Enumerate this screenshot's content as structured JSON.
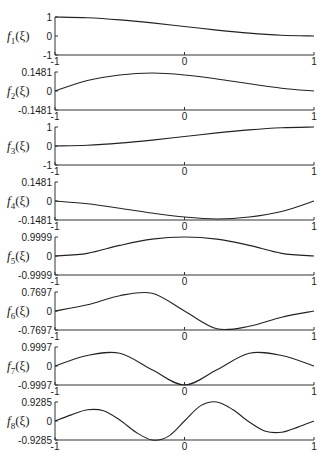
{
  "chart_data": [
    {
      "type": "line",
      "title": "",
      "ylabel": "f_1(ξ)",
      "ylabel_base": "f",
      "ylabel_sub": "1",
      "xlim": [
        -1,
        1
      ],
      "ylim": [
        -1,
        1
      ],
      "xticks": [
        "-1",
        "0",
        "1"
      ],
      "yticks": [
        "1",
        "0",
        "-1"
      ],
      "x": [
        -1,
        -0.75,
        -0.5,
        -0.25,
        0,
        0.25,
        0.5,
        0.75,
        1
      ],
      "y": [
        1.0,
        0.96,
        0.85,
        0.69,
        0.5,
        0.31,
        0.15,
        0.04,
        0.0
      ]
    },
    {
      "type": "line",
      "title": "",
      "ylabel": "f_2(ξ)",
      "ylabel_base": "f",
      "ylabel_sub": "2",
      "xlim": [
        -1,
        1
      ],
      "ylim": [
        -0.1481,
        0.1481
      ],
      "xticks": [
        "-1",
        "0",
        "1"
      ],
      "yticks": [
        "0.1481",
        "0",
        "-0.1481"
      ],
      "x": [
        -1,
        -0.75,
        -0.5,
        -0.25,
        0,
        0.25,
        0.5,
        0.75,
        1
      ],
      "y": [
        0.0,
        0.082,
        0.125,
        0.14,
        0.125,
        0.094,
        0.056,
        0.022,
        0.0
      ]
    },
    {
      "type": "line",
      "title": "",
      "ylabel": "f_3(ξ)",
      "ylabel_base": "f",
      "ylabel_sub": "3",
      "xlim": [
        -1,
        1
      ],
      "ylim": [
        -1,
        1
      ],
      "xticks": [
        "-1",
        "0",
        "1"
      ],
      "yticks": [
        "1",
        "0",
        "-1"
      ],
      "x": [
        -1,
        -0.75,
        -0.5,
        -0.25,
        0,
        0.25,
        0.5,
        0.75,
        1
      ],
      "y": [
        0.0,
        0.04,
        0.15,
        0.31,
        0.5,
        0.69,
        0.85,
        0.96,
        1.0
      ]
    },
    {
      "type": "line",
      "title": "",
      "ylabel": "f_4(ξ)",
      "ylabel_base": "f",
      "ylabel_sub": "4",
      "xlim": [
        -1,
        1
      ],
      "ylim": [
        -0.1481,
        0.1481
      ],
      "xticks": [
        "-1",
        "0",
        "1"
      ],
      "yticks": [
        "0.1481",
        "0",
        "-0.1481"
      ],
      "x": [
        -1,
        -0.75,
        -0.5,
        -0.25,
        0,
        0.25,
        0.5,
        0.75,
        1
      ],
      "y": [
        0.0,
        -0.022,
        -0.056,
        -0.094,
        -0.125,
        -0.14,
        -0.125,
        -0.082,
        0.0
      ]
    },
    {
      "type": "line",
      "title": "",
      "ylabel": "f_5(ξ)",
      "ylabel_base": "f",
      "ylabel_sub": "5",
      "xlim": [
        -1,
        1
      ],
      "ylim": [
        -0.9999,
        0.9999
      ],
      "xticks": [
        "-1",
        "0",
        "1"
      ],
      "yticks": [
        "0.9999",
        "0",
        "-0.9999"
      ],
      "x": [
        -1,
        -0.75,
        -0.5,
        -0.25,
        0,
        0.25,
        0.5,
        0.75,
        1
      ],
      "y": [
        0.0,
        0.14,
        0.56,
        0.89,
        1.0,
        0.89,
        0.56,
        0.14,
        0.0
      ]
    },
    {
      "type": "line",
      "title": "",
      "ylabel": "f_6(ξ)",
      "ylabel_base": "f",
      "ylabel_sub": "6",
      "xlim": [
        -1,
        1
      ],
      "ylim": [
        -0.7697,
        0.7697
      ],
      "xticks": [
        "-1",
        "0",
        "1"
      ],
      "yticks": [
        "0.7697",
        "0",
        "-0.7697"
      ],
      "x": [
        -1,
        -0.75,
        -0.5,
        -0.25,
        0,
        0.25,
        0.5,
        0.75,
        1
      ],
      "y": [
        0.0,
        0.25,
        0.62,
        0.72,
        0.0,
        -0.72,
        -0.62,
        -0.25,
        0.0
      ]
    },
    {
      "type": "line",
      "title": "",
      "ylabel": "f_7(ξ)",
      "ylabel_base": "f",
      "ylabel_sub": "7",
      "xlim": [
        -1,
        1
      ],
      "ylim": [
        -0.9997,
        0.9997
      ],
      "xticks": [
        "-1",
        "0",
        "1"
      ],
      "yticks": [
        "0.9997",
        "0",
        "-0.9997"
      ],
      "x": [
        -1,
        -0.75,
        -0.5,
        -0.25,
        0,
        0.25,
        0.5,
        0.75,
        1
      ],
      "y": [
        0.0,
        0.55,
        0.67,
        -0.2,
        -1.0,
        -0.2,
        0.67,
        0.55,
        0.0
      ]
    },
    {
      "type": "line",
      "title": "",
      "ylabel": "f_8(ξ)",
      "ylabel_base": "f",
      "ylabel_sub": "8",
      "xlim": [
        -1,
        1
      ],
      "ylim": [
        -0.9285,
        0.9285
      ],
      "xticks": [
        "-1",
        "0",
        "1"
      ],
      "yticks": [
        "0.9285",
        "0",
        "-0.9285"
      ],
      "x": [
        -1,
        -0.875,
        -0.75,
        -0.625,
        -0.5,
        -0.375,
        -0.25,
        -0.125,
        0,
        0.125,
        0.25,
        0.375,
        0.5,
        0.625,
        0.75,
        0.875,
        1
      ],
      "y": [
        0.0,
        0.3,
        0.55,
        0.5,
        0.05,
        -0.55,
        -0.93,
        -0.75,
        0.0,
        0.75,
        0.93,
        0.55,
        -0.05,
        -0.5,
        -0.55,
        -0.3,
        0.0
      ]
    }
  ]
}
